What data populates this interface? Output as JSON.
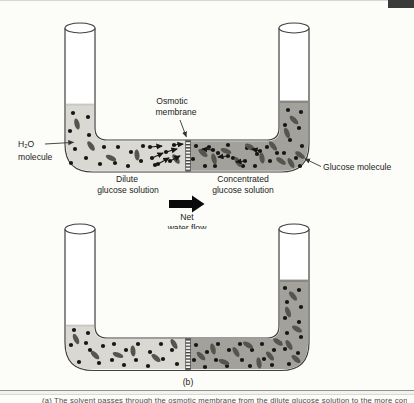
{
  "figure": {
    "colors": {
      "dilute_solution": "#d9d8d2",
      "concentrated_solution": "#a2a19b",
      "glucose": "#55544e",
      "water": "#161616",
      "outline": "#3f3f3f",
      "corner_tab": "#3a3a3a"
    },
    "caption": "(a) The solvent passes through the osmotic membrane from the dilute glucose solution to the more concentrated glucose solution (b)",
    "panel_a": {
      "label": "(a)",
      "osmotic_membrane_label": {
        "line1": "Osmotic",
        "line2": "membrane"
      },
      "h2o_label": {
        "line1": "H₂O",
        "line2": "molecule"
      },
      "dilute_label": {
        "line1": "Dilute",
        "line2": "glucose solution"
      },
      "concentrated_label": {
        "line1": "Concentrated",
        "line2": "glucose solution"
      },
      "glucose_label": "Glucose molecule",
      "net_flow_label": {
        "line1": "Net",
        "line2": "water flow"
      },
      "molecules": {
        "left_dots": [
          [
            73,
            113
          ],
          [
            88,
            117
          ],
          [
            70,
            131
          ],
          [
            89,
            135
          ],
          [
            75,
            149
          ],
          [
            71,
            163
          ],
          [
            86,
            158
          ],
          [
            104,
            147
          ],
          [
            100,
            164
          ],
          [
            118,
            147
          ],
          [
            115,
            163
          ],
          [
            131,
            152
          ],
          [
            128,
            166
          ],
          [
            143,
            146
          ],
          [
            141,
            161
          ],
          [
            155,
            165
          ]
        ],
        "left_ellipses": [
          [
            77,
            124,
            75
          ],
          [
            91,
            146,
            55
          ],
          [
            111,
            158,
            25
          ],
          [
            137,
            155,
            85
          ],
          [
            176,
            159,
            55
          ]
        ],
        "left_arrows": [
          [
            150,
            147,
            162,
            146
          ],
          [
            152,
            158,
            163,
            153
          ],
          [
            158,
            164,
            169,
            158
          ],
          [
            166,
            152,
            177,
            149
          ],
          [
            170,
            161,
            180,
            156
          ],
          [
            174,
            145,
            183,
            144
          ]
        ],
        "right_dots": [
          [
            196,
            146
          ],
          [
            193,
            159
          ],
          [
            205,
            166
          ],
          [
            209,
            147
          ],
          [
            218,
            153
          ],
          [
            215,
            166
          ],
          [
            228,
            145
          ],
          [
            233,
            158
          ],
          [
            243,
            166
          ],
          [
            247,
            148
          ],
          [
            257,
            154
          ],
          [
            255,
            166
          ],
          [
            267,
            147
          ],
          [
            270,
            161
          ],
          [
            277,
            153
          ],
          [
            288,
            110
          ],
          [
            301,
            112
          ],
          [
            285,
            125
          ],
          [
            299,
            128
          ],
          [
            290,
            140
          ],
          [
            302,
            146
          ],
          [
            284,
            153
          ],
          [
            296,
            158
          ],
          [
            300,
            166
          ]
        ],
        "right_ellipses": [
          [
            203,
            153,
            40
          ],
          [
            214,
            159,
            75
          ],
          [
            226,
            151,
            20
          ],
          [
            238,
            162,
            60
          ],
          [
            250,
            147,
            30
          ],
          [
            262,
            158,
            80
          ],
          [
            273,
            146,
            50
          ],
          [
            281,
            161,
            35
          ],
          [
            294,
            120,
            45
          ],
          [
            287,
            133,
            70
          ],
          [
            300,
            155,
            35
          ],
          [
            291,
            163,
            60
          ]
        ],
        "right_arrows": [
          [
            213,
            150,
            202,
            149
          ],
          [
            228,
            156,
            218,
            157
          ],
          [
            245,
            161,
            236,
            162
          ],
          [
            260,
            151,
            252,
            149
          ]
        ]
      }
    },
    "panel_b": {
      "label": "(b)",
      "molecules": {
        "left_dots": [
          [
            74,
            330
          ],
          [
            88,
            333
          ],
          [
            71,
            345
          ],
          [
            90,
            350
          ],
          [
            79,
            362
          ],
          [
            86,
            343
          ],
          [
            103,
            346
          ],
          [
            99,
            363
          ],
          [
            114,
            344
          ],
          [
            112,
            360
          ],
          [
            126,
            350
          ],
          [
            124,
            365
          ],
          [
            138,
            344
          ],
          [
            136,
            360
          ],
          [
            150,
            352
          ],
          [
            148,
            366
          ],
          [
            161,
            344
          ],
          [
            163,
            359
          ],
          [
            172,
            350
          ],
          [
            177,
            364
          ]
        ],
        "left_ellipses": [
          [
            76,
            339,
            65
          ],
          [
            95,
            355,
            45
          ],
          [
            118,
            355,
            20
          ],
          [
            133,
            351,
            85
          ],
          [
            156,
            358,
            40
          ],
          [
            174,
            344,
            60
          ]
        ],
        "right_dots": [
          [
            196,
            345
          ],
          [
            194,
            360
          ],
          [
            207,
            352
          ],
          [
            205,
            367
          ],
          [
            218,
            344
          ],
          [
            216,
            360
          ],
          [
            229,
            350
          ],
          [
            227,
            366
          ],
          [
            240,
            344
          ],
          [
            242,
            360
          ],
          [
            252,
            350
          ],
          [
            250,
            366
          ],
          [
            262,
            344
          ],
          [
            264,
            359
          ],
          [
            274,
            350
          ],
          [
            272,
            365
          ],
          [
            280,
            343
          ],
          [
            285,
            288
          ],
          [
            299,
            290
          ],
          [
            287,
            302
          ],
          [
            301,
            307
          ],
          [
            285,
            318
          ],
          [
            299,
            322
          ],
          [
            287,
            333
          ],
          [
            301,
            337
          ],
          [
            285,
            349
          ],
          [
            298,
            353
          ],
          [
            289,
            364
          ]
        ],
        "right_ellipses": [
          [
            201,
            356,
            45
          ],
          [
            213,
            349,
            75
          ],
          [
            224,
            362,
            20
          ],
          [
            236,
            352,
            60
          ],
          [
            248,
            345,
            30
          ],
          [
            259,
            363,
            80
          ],
          [
            270,
            356,
            50
          ],
          [
            278,
            342,
            35
          ],
          [
            293,
            296,
            50
          ],
          [
            288,
            312,
            70
          ],
          [
            297,
            329,
            30
          ],
          [
            289,
            345,
            60
          ],
          [
            296,
            359,
            40
          ]
        ]
      }
    }
  }
}
